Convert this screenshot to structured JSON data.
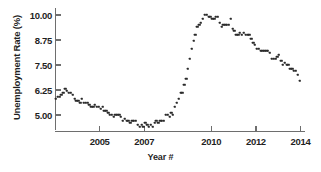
{
  "chart_data": {
    "type": "scatter",
    "title": "",
    "xlabel": "Year #",
    "ylabel": "Unemployment Rate (%)",
    "xlim": [
      2003.0,
      2014.2
    ],
    "ylim": [
      4.2,
      10.35
    ],
    "grid": false,
    "legend": "none",
    "marker": "square",
    "marker_color": "#2a2a2a",
    "axis_color": "#6e6e6e",
    "xticks": [
      2005,
      2007,
      2010,
      2012,
      2014
    ],
    "xtick_labels": [
      "2005",
      "2007",
      "2010",
      "2012",
      "2014"
    ],
    "yticks": [
      5.0,
      6.25,
      7.5,
      8.75,
      10.0
    ],
    "ytick_labels": [
      "5.00",
      "6.25",
      "7.50",
      "8.75",
      "10.00"
    ],
    "series": [
      {
        "name": "Unemployment Rate",
        "x": [
          2003.04,
          2003.13,
          2003.21,
          2003.29,
          2003.38,
          2003.46,
          2003.54,
          2003.63,
          2003.71,
          2003.79,
          2003.88,
          2003.96,
          2004.04,
          2004.13,
          2004.21,
          2004.29,
          2004.38,
          2004.46,
          2004.54,
          2004.63,
          2004.71,
          2004.79,
          2004.88,
          2004.96,
          2005.04,
          2005.13,
          2005.21,
          2005.29,
          2005.38,
          2005.46,
          2005.54,
          2005.63,
          2005.71,
          2005.79,
          2005.88,
          2005.96,
          2006.04,
          2006.13,
          2006.21,
          2006.29,
          2006.38,
          2006.46,
          2006.54,
          2006.63,
          2006.71,
          2006.79,
          2006.88,
          2006.96,
          2007.04,
          2007.13,
          2007.21,
          2007.29,
          2007.38,
          2007.46,
          2007.54,
          2007.63,
          2007.71,
          2007.79,
          2007.88,
          2007.96,
          2008.04,
          2008.13,
          2008.21,
          2008.29,
          2008.38,
          2008.46,
          2008.54,
          2008.63,
          2008.71,
          2008.79,
          2008.88,
          2008.96,
          2009.04,
          2009.13,
          2009.21,
          2009.29,
          2009.38,
          2009.46,
          2009.54,
          2009.63,
          2009.71,
          2009.79,
          2009.88,
          2009.96,
          2010.04,
          2010.13,
          2010.21,
          2010.29,
          2010.38,
          2010.46,
          2010.54,
          2010.63,
          2010.71,
          2010.79,
          2010.88,
          2010.96,
          2011.04,
          2011.13,
          2011.21,
          2011.29,
          2011.38,
          2011.46,
          2011.54,
          2011.63,
          2011.71,
          2011.79,
          2011.88,
          2011.96,
          2012.04,
          2012.13,
          2012.21,
          2012.29,
          2012.38,
          2012.46,
          2012.54,
          2012.63,
          2012.71,
          2012.79,
          2012.88,
          2012.96,
          2013.04,
          2013.13,
          2013.21,
          2013.29,
          2013.38,
          2013.46,
          2013.54,
          2013.63,
          2013.71,
          2013.79,
          2013.88,
          2013.96
        ],
        "values": [
          5.8,
          5.9,
          5.9,
          6.0,
          6.1,
          6.3,
          6.2,
          6.1,
          6.1,
          6.0,
          5.8,
          5.7,
          5.7,
          5.6,
          5.8,
          5.6,
          5.6,
          5.6,
          5.5,
          5.4,
          5.4,
          5.5,
          5.4,
          5.4,
          5.3,
          5.4,
          5.2,
          5.2,
          5.1,
          5.0,
          5.0,
          4.9,
          5.0,
          5.0,
          5.0,
          4.9,
          4.7,
          4.8,
          4.7,
          4.7,
          4.6,
          4.7,
          4.7,
          4.7,
          4.5,
          4.4,
          4.5,
          4.4,
          4.6,
          4.5,
          4.4,
          4.5,
          4.4,
          4.6,
          4.7,
          4.6,
          4.7,
          4.7,
          4.7,
          5.0,
          5.0,
          4.9,
          5.1,
          5.0,
          5.4,
          5.6,
          5.8,
          6.1,
          6.1,
          6.5,
          6.8,
          7.3,
          7.8,
          8.3,
          8.7,
          9.0,
          9.4,
          9.5,
          9.6,
          9.8,
          10.0,
          10.0,
          9.9,
          9.9,
          9.8,
          9.8,
          9.9,
          9.9,
          9.6,
          9.4,
          9.5,
          9.5,
          9.5,
          9.5,
          9.8,
          9.3,
          9.2,
          9.0,
          9.0,
          9.1,
          9.0,
          9.1,
          9.0,
          9.0,
          9.0,
          8.8,
          8.6,
          8.5,
          8.3,
          8.3,
          8.2,
          8.2,
          8.2,
          8.2,
          8.2,
          8.1,
          7.8,
          7.8,
          7.8,
          7.9,
          8.0,
          7.7,
          7.5,
          7.6,
          7.5,
          7.5,
          7.3,
          7.3,
          7.2,
          7.2,
          7.0,
          6.7
        ]
      }
    ]
  },
  "axes": {
    "x_title": "Year #",
    "y_title": "Unemployment Rate (%)"
  }
}
